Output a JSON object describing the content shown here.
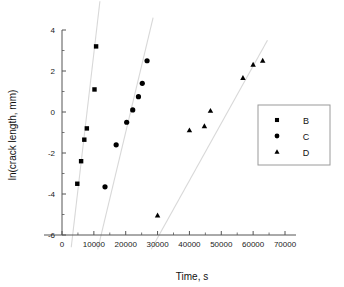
{
  "chart_data": {
    "type": "scatter",
    "title": "",
    "xlabel": "Time, s",
    "ylabel": "ln(crack length, mm)",
    "xlim": [
      -4000,
      74000
    ],
    "ylim": [
      -6,
      4
    ],
    "xticks": [
      0,
      10000,
      20000,
      30000,
      40000,
      50000,
      60000,
      70000
    ],
    "xtick_labels": [
      "0",
      "10000",
      "20000",
      "30000",
      "40000",
      "50000",
      "60000",
      "70000"
    ],
    "yticks": [
      -6,
      -4,
      -2,
      0,
      2,
      4
    ],
    "ytick_labels": [
      "-6",
      "-4",
      "-2",
      "0",
      "2",
      "4"
    ],
    "xminor_step": 5000,
    "yminor_step": 1,
    "grid": false,
    "legend_position": "right",
    "marker_color": "#000000",
    "trend_color": "#d8d8d8",
    "series": [
      {
        "name": "B",
        "marker": "square",
        "points": [
          [
            4800,
            -3.5
          ],
          [
            6000,
            -2.4
          ],
          [
            7000,
            -1.35
          ],
          [
            7800,
            -0.8
          ],
          [
            10200,
            1.1
          ],
          [
            10700,
            3.2
          ]
        ],
        "trend": [
          [
            2900,
            -6.6
          ],
          [
            11900,
            5.4
          ]
        ]
      },
      {
        "name": "C",
        "marker": "circle",
        "points": [
          [
            13500,
            -3.65
          ],
          [
            17000,
            -1.6
          ],
          [
            20300,
            -0.5
          ],
          [
            22200,
            0.1
          ],
          [
            24000,
            0.75
          ],
          [
            25200,
            1.4
          ],
          [
            26700,
            2.5
          ]
        ],
        "trend": [
          [
            11200,
            -6.7
          ],
          [
            28600,
            4.6
          ]
        ]
      },
      {
        "name": "D",
        "marker": "triangle",
        "points": [
          [
            30000,
            -5.05
          ],
          [
            40000,
            -0.9
          ],
          [
            44700,
            -0.7
          ],
          [
            46600,
            0.05
          ],
          [
            56800,
            1.65
          ],
          [
            60000,
            2.3
          ],
          [
            63000,
            2.5
          ]
        ],
        "trend": [
          [
            28000,
            -6.7
          ],
          [
            64500,
            3.5
          ]
        ]
      }
    ]
  },
  "legend": {
    "items": [
      {
        "label": "B",
        "marker": "square"
      },
      {
        "label": "C",
        "marker": "circle"
      },
      {
        "label": "D",
        "marker": "triangle"
      }
    ]
  }
}
